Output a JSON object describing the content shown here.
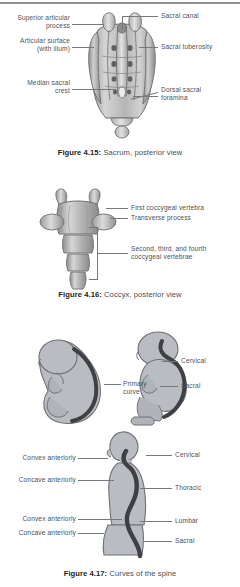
{
  "page": {
    "background": "#ffffff",
    "label_color": "#4e5156",
    "leader_color": "#75787d",
    "bone_light": "#d8d8d8",
    "bone_mid": "#a8a8a8",
    "bone_dark": "#6f6f6f",
    "body_fill": "#b9bcc0",
    "spine_dark": "#3e4044",
    "rule_color": "#8d9095"
  },
  "figures": [
    {
      "id": "figure-4-15",
      "caption_number": "Figure 4.15:",
      "caption_text": " Sacrum, posterior view",
      "subject": "sacrum-posterior-view",
      "labels": [
        {
          "name": "superior-articular-process",
          "text": "Superior articular\nprocess",
          "side": "left"
        },
        {
          "name": "articular-surface",
          "text": "Articular surface\n(with ilium)",
          "side": "left"
        },
        {
          "name": "median-sacral-crest",
          "text": "Median sacral\ncrest",
          "side": "left"
        },
        {
          "name": "sacral-canal",
          "text": "Sacral canal",
          "side": "right"
        },
        {
          "name": "sacral-tuberosity",
          "text": "Sacral tuberosity",
          "side": "right"
        },
        {
          "name": "dorsal-sacral-foramina",
          "text": "Dorsal sacral\nforamina",
          "side": "right"
        }
      ]
    },
    {
      "id": "figure-4-16",
      "caption_number": "Figure 4.16:",
      "caption_text": " Coccyx, posterior view",
      "subject": "coccyx-posterior-view",
      "labels": [
        {
          "name": "first-coccygeal-vertebra",
          "text": "First coccygeal vertebra",
          "side": "right"
        },
        {
          "name": "transverse-process",
          "text": "Transverse process",
          "side": "right"
        },
        {
          "name": "second-third-fourth-coccygeal-vertebrae",
          "text": "Second, third, and fourth\ncoccygeal vertebrae",
          "side": "right"
        }
      ]
    },
    {
      "id": "figure-4-17",
      "caption_number": "Figure 4.17:",
      "caption_text": " Curves of the spine",
      "subject": "curves-of-the-spine",
      "labels": [
        {
          "name": "primary-curve",
          "text": "Primary\ncurve",
          "side": "right"
        },
        {
          "name": "fetus-cervical",
          "text": "Cervical",
          "side": "right"
        },
        {
          "name": "fetus-sacral",
          "text": "Sacral",
          "side": "right"
        },
        {
          "name": "adult-convex-anteriorly-cervical",
          "text": "Convex anteriorly",
          "side": "left"
        },
        {
          "name": "adult-concave-anteriorly-thoracic",
          "text": "Concave anteriorly",
          "side": "left"
        },
        {
          "name": "adult-convex-anteriorly-lumbar",
          "text": "Convex anteriorly",
          "side": "left"
        },
        {
          "name": "adult-concave-anteriorly-sacral",
          "text": "Concave anteriorly",
          "side": "left"
        },
        {
          "name": "adult-cervical",
          "text": "Cervical",
          "side": "right"
        },
        {
          "name": "adult-thoracic",
          "text": "Thoracic",
          "side": "right"
        },
        {
          "name": "adult-lumbar",
          "text": "Lumbar",
          "side": "right"
        },
        {
          "name": "adult-sacral",
          "text": "Sacral",
          "side": "right"
        }
      ]
    }
  ]
}
